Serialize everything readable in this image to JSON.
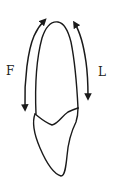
{
  "diagram": {
    "type": "tooth-outline-with-directional-arrows",
    "labels": {
      "left": "F",
      "right": "L"
    },
    "arrows": [
      {
        "side": "left",
        "label": "F",
        "direction": "bidirectional",
        "description": "curved arrow along facial surface"
      },
      {
        "side": "right",
        "label": "L",
        "direction": "bidirectional",
        "description": "curved arrow along lingual surface"
      }
    ],
    "colors": {
      "stroke": "#1a1a1a",
      "background": "#ffffff"
    }
  }
}
